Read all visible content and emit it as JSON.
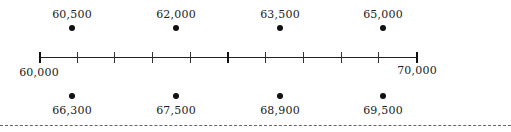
{
  "number_line": {
    "start_label": "60,000",
    "end_label": "70,000",
    "min": 60000,
    "max": 70000,
    "tick_count": 11,
    "tick_interval": 1000
  },
  "top_points": [
    {
      "label": "60,500"
    },
    {
      "label": "62,000"
    },
    {
      "label": "63,500"
    },
    {
      "label": "65,000"
    }
  ],
  "bottom_points": [
    {
      "label": "66,300"
    },
    {
      "label": "67,500"
    },
    {
      "label": "68,900"
    },
    {
      "label": "69,500"
    }
  ]
}
